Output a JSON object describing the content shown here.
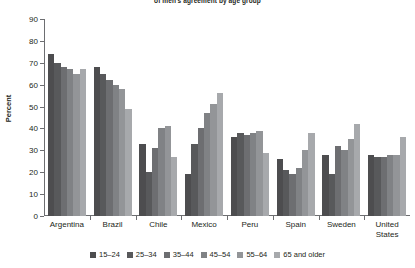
{
  "chart_data": {
    "type": "bar",
    "title": "of men's agreement by age group",
    "ylabel": "Percent",
    "xlabel": "",
    "ylim": [
      0,
      90
    ],
    "yticks": [
      0,
      10,
      20,
      30,
      40,
      50,
      60,
      70,
      80,
      90
    ],
    "grid": false,
    "legend_position": "bottom",
    "categories": [
      "Argentina",
      "Brazil",
      "Chile",
      "Mexico",
      "Peru",
      "Spain",
      "Sweden",
      "United States"
    ],
    "series": [
      {
        "name": "15–24",
        "color": "#4d4d4f",
        "values": [
          74,
          68,
          33,
          19,
          36,
          26,
          28,
          28
        ]
      },
      {
        "name": "25–34",
        "color": "#58595b",
        "values": [
          70,
          65,
          20,
          33,
          38,
          21,
          19,
          27
        ]
      },
      {
        "name": "35–44",
        "color": "#6d6e71",
        "values": [
          68,
          62,
          31,
          40,
          37,
          19,
          32,
          27
        ]
      },
      {
        "name": "45–54",
        "color": "#808285",
        "values": [
          67,
          60,
          40,
          47,
          38,
          22,
          30,
          28
        ]
      },
      {
        "name": "55–64",
        "color": "#939598",
        "values": [
          65,
          58,
          41,
          51,
          39,
          30,
          35,
          28
        ]
      },
      {
        "name": "65 and older",
        "color": "#a7a9ac",
        "values": [
          67,
          49,
          27,
          56,
          29,
          38,
          42,
          36
        ]
      }
    ]
  },
  "axis": {
    "y_title": "Percent"
  }
}
